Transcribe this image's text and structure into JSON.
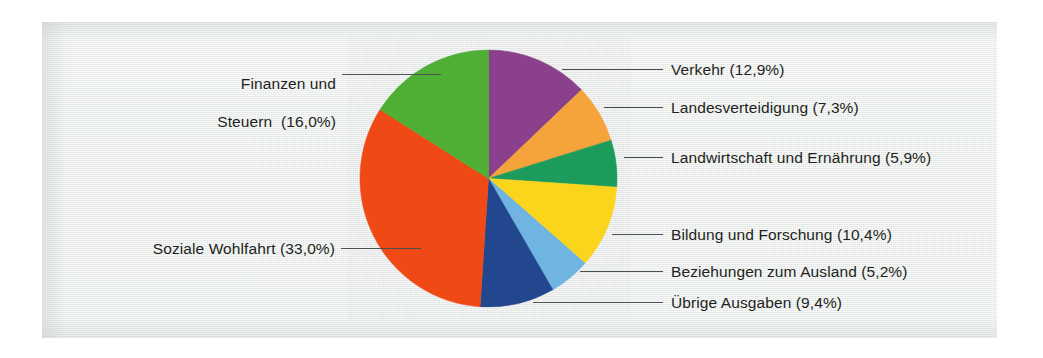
{
  "figure": {
    "kind": "pie-chart",
    "background_color": "#eef1ef",
    "label_color": "#231f20",
    "leader_color": "#4b4f50"
  },
  "chart_data": {
    "type": "pie",
    "title": "",
    "subtitle": "",
    "xlabel": "",
    "ylabel": "",
    "grid": false,
    "legend_position": "callout-labels",
    "value_unit": "%",
    "decimal_separator": ",",
    "start_angle_deg": 0,
    "direction": "clockwise",
    "categories": [
      "Verkehr",
      "Landesverteidigung",
      "Landwirtschaft und Ernährung",
      "Bildung und Forschung",
      "Beziehungen zum Ausland",
      "Übrige Ausgaben",
      "Soziale Wohlfahrt",
      "Finanzen und Steuern"
    ],
    "values": [
      12.9,
      7.3,
      5.9,
      10.4,
      5.2,
      9.4,
      33.0,
      16.0
    ],
    "colors": [
      "#8b3f8c",
      "#f5a33a",
      "#1c9c5c",
      "#fbd51f",
      "#6fb4e2",
      "#20468f",
      "#ef4a16",
      "#4faf34"
    ],
    "slices": [
      {
        "name": "Verkehr",
        "value": 12.9,
        "color": "#8b3f8c",
        "label": "Verkehr (12,9%)"
      },
      {
        "name": "Landesverteidigung",
        "value": 7.3,
        "color": "#f5a33a",
        "label": "Landesverteidigung (7,3%)"
      },
      {
        "name": "Landwirtschaft und Ernährung",
        "value": 5.9,
        "color": "#1c9c5c",
        "label": "Landwirtschaft und Ernährung (5,9%)"
      },
      {
        "name": "Bildung und Forschung",
        "value": 10.4,
        "color": "#fbd51f",
        "label": "Bildung und Forschung (10,4%)"
      },
      {
        "name": "Beziehungen zum Ausland",
        "value": 5.2,
        "color": "#6fb4e2",
        "label": "Beziehungen zum Ausland (5,2%)"
      },
      {
        "name": "Übrige Ausgaben",
        "value": 9.4,
        "color": "#20468f",
        "label": "Übrige Ausgaben (9,4%)"
      },
      {
        "name": "Soziale Wohlfahrt",
        "value": 33.0,
        "color": "#ef4a16",
        "label": "Soziale Wohlfahrt (33,0%)"
      },
      {
        "name": "Finanzen und Steuern",
        "value": 16.0,
        "color": "#4faf34",
        "label": "Finanzen und Steuern  (16,0%)"
      }
    ]
  },
  "labels": {
    "verkehr": "Verkehr (12,9%)",
    "landesverteidigung": "Landesverteidigung (7,3%)",
    "landwirtschaft": "Landwirtschaft und Ernährung (5,9%)",
    "bildung": "Bildung und Forschung (10,4%)",
    "beziehungen": "Beziehungen zum Ausland (5,2%)",
    "uebrige": "Übrige Ausgaben (9,4%)",
    "soziale": "Soziale Wohlfahrt (33,0%)",
    "finanzen_line1": "Finanzen und",
    "finanzen_line2": "Steuern  (16,0%)"
  }
}
